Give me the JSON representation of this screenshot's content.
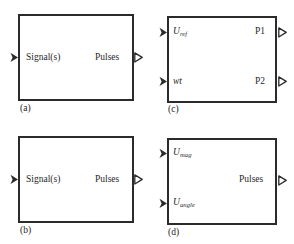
{
  "figure": {
    "type": "block-diagram-set",
    "background_color": "#ffffff",
    "line_color": "#2b2b2b",
    "text_color": "#1f1f1f",
    "blocks": [
      {
        "id": "a",
        "caption": "(a)",
        "inputs": [
          {
            "label": "Signal(s)",
            "style": "roman",
            "port_type": "filled-arrow"
          }
        ],
        "outputs": [
          {
            "label": "Pulses",
            "style": "roman",
            "port_type": "hollow-arrow"
          }
        ]
      },
      {
        "id": "b",
        "caption": "(b)",
        "inputs": [
          {
            "label": "Signal(s)",
            "style": "roman",
            "port_type": "filled-arrow"
          }
        ],
        "outputs": [
          {
            "label": "Pulses",
            "style": "roman",
            "port_type": "hollow-arrow"
          }
        ]
      },
      {
        "id": "c",
        "caption": "(c)",
        "inputs": [
          {
            "label": "U",
            "subscript": "ref",
            "style": "italic",
            "port_type": "filled-arrow"
          },
          {
            "label": "wt",
            "subscript": "",
            "style": "italic",
            "port_type": "filled-arrow"
          }
        ],
        "outputs": [
          {
            "label": "P1",
            "style": "roman",
            "port_type": "hollow-arrow"
          },
          {
            "label": "P2",
            "style": "roman",
            "port_type": "hollow-arrow"
          }
        ]
      },
      {
        "id": "d",
        "caption": "(d)",
        "inputs": [
          {
            "label": "U",
            "subscript": "mag",
            "style": "italic",
            "port_type": "filled-arrow"
          },
          {
            "label": "U",
            "subscript": "angle",
            "style": "italic",
            "port_type": "filled-arrow"
          }
        ],
        "outputs": [
          {
            "label": "Pulses",
            "style": "roman",
            "port_type": "hollow-arrow"
          }
        ]
      }
    ]
  }
}
